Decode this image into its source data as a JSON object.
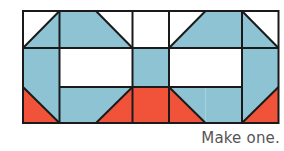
{
  "caption": "Make one.",
  "colors": {
    "blue": "#8ec3d3",
    "red": "#f0533a",
    "white": "#ffffff",
    "line": "#1a1a1a"
  },
  "quilt_block": {
    "grid": {
      "columns": 7,
      "rows": 3
    },
    "description": "Patchwork quilt block pattern in blue, red and white"
  }
}
